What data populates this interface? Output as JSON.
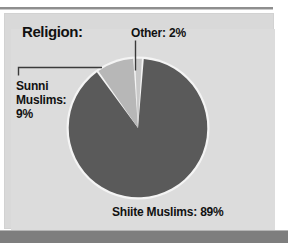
{
  "figure": {
    "title": "Religion:",
    "background_color": "#ffffff",
    "panel_color": "#d9d9d9",
    "bottom_bar_color": "#7e7e7e",
    "rule_color": "#8e8e8e",
    "text_color": "#111111"
  },
  "labels": {
    "sunni": "Sunni\nMuslims:\n9%",
    "other": "Other: 2%",
    "shiite": "Shiite Muslims: 89%"
  },
  "chart_data": {
    "type": "pie",
    "title": "Religion:",
    "xlabel": "",
    "ylabel": "",
    "unit": "percent",
    "start_angle_deg": 0,
    "direction": "clockwise",
    "legend": "none",
    "grid": false,
    "categories": [
      "Shiite Muslims",
      "Sunni Muslims",
      "Other"
    ],
    "values": [
      89,
      9,
      2
    ],
    "labels": [
      "Shiite Muslims: 89%",
      "Sunni Muslims: 9%",
      "Other: 2%"
    ],
    "colors": [
      "#5a5a5a",
      "#b7b7b7",
      "#c9c9c9"
    ],
    "slice_separator_color": "#f2f2f2",
    "outline_color": "#f4f4f4",
    "annotations": [
      {
        "name": "sunni-leader",
        "text": "Sunni Muslims: 9%",
        "points_to": "sunni-slice"
      },
      {
        "name": "other-leader",
        "text": "Other: 2%",
        "points_to": "other-slice"
      },
      {
        "name": "shiite-label",
        "text": "Shiite Muslims: 89%",
        "points_to": "shiite-slice"
      }
    ]
  }
}
